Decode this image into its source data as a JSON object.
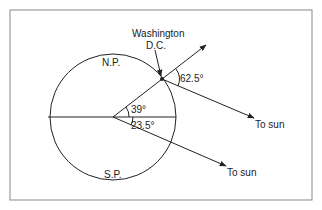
{
  "labels": {
    "north_pole": "N.P.",
    "south_pole": "S.P.",
    "city_line1": "Washington",
    "city_line2": "D.C.",
    "angle_latitude": "39°",
    "angle_tilt": "23.5°",
    "angle_elevation": "62.5°",
    "sun_upper": "To sun",
    "sun_lower": "To sun"
  },
  "colors": {
    "stroke": "#222222",
    "frame": "#888888",
    "background": "#ffffff"
  }
}
